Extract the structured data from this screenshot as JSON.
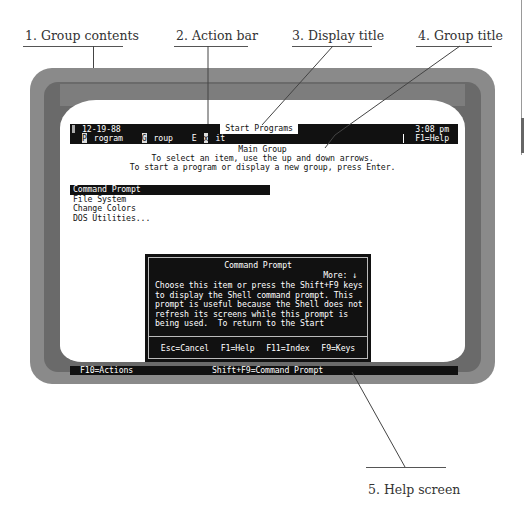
{
  "callouts": [
    {
      "id": 1,
      "label": "1. Group contents"
    },
    {
      "id": 2,
      "label": "2. Action bar"
    },
    {
      "id": 3,
      "label": "3. Display title"
    },
    {
      "id": 4,
      "label": "4. Group title"
    },
    {
      "id": 5,
      "label": "5. Help screen"
    }
  ],
  "shell": {
    "date": "12-19-88",
    "display_title": "Start Programs",
    "time": "3:08 pm",
    "menu": [
      {
        "hot": "P",
        "rest": "rogram"
      },
      {
        "hot": "G",
        "rest": "roup"
      },
      {
        "pre": "E",
        "hot": "x",
        "rest": "it"
      }
    ],
    "help_key": "F1=Help",
    "group_title": "Main Group",
    "instructions": [
      "To select an item, use the up and down arrows.",
      "To start a program or display a new group, press Enter."
    ],
    "items": [
      {
        "label": "Command Prompt",
        "selected": true
      },
      {
        "label": "File System",
        "selected": false
      },
      {
        "label": "Change Colors",
        "selected": false
      },
      {
        "label": "DOS Utilities...",
        "selected": false
      }
    ],
    "status": {
      "left": "F10=Actions",
      "center": "Shift+F9=Command Prompt"
    }
  },
  "help_dialog": {
    "title": "Command Prompt",
    "more": "More: ↓",
    "body": [
      "Choose this item or press the Shift+F9 keys",
      "to display the Shell command prompt. This",
      "prompt is useful because the Shell does not",
      "refresh its screens while this prompt is",
      "being used.  To return to the Start"
    ],
    "keys": [
      "Esc=Cancel",
      "F1=Help",
      "F11=Index",
      "F9=Keys"
    ]
  }
}
